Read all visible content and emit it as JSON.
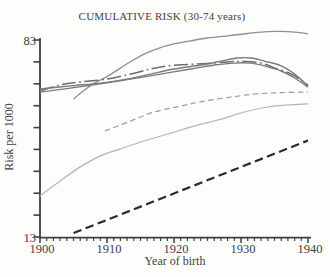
{
  "chart_data": {
    "type": "line",
    "title": "CUMULATIVE RISK (30-74 years)",
    "xlabel": "Year of birth",
    "ylabel": "Risk per 1000",
    "x_axis": {
      "min": 1900,
      "max": 1940,
      "major_ticks": [
        1900,
        1910,
        1920,
        1930,
        1940
      ],
      "tick_labels": [
        "1900",
        "1910",
        "1920",
        "1930",
        "1940"
      ],
      "minor_tick_interval": 1
    },
    "y_axis": {
      "min": 13,
      "max": 83,
      "tick_count": 10,
      "labeled_ticks": [
        {
          "label": "83",
          "value": 83
        },
        {
          "label": "13",
          "value": 13
        }
      ]
    },
    "grid": false,
    "legend": "none",
    "series": [
      {
        "name": "upper-solid-curve",
        "line_style": "solid",
        "color": "#8f8f8f",
        "width": 1.3,
        "points": [
          [
            1905,
            62.0
          ],
          [
            1906.5,
            65.0
          ],
          [
            1908,
            67.5
          ],
          [
            1910,
            70.0
          ],
          [
            1912,
            73.0
          ],
          [
            1914,
            76.0
          ],
          [
            1916,
            78.5
          ],
          [
            1918,
            80.3
          ],
          [
            1920,
            81.6
          ],
          [
            1922,
            82.5
          ],
          [
            1925,
            83.7
          ],
          [
            1928,
            84.5
          ],
          [
            1931,
            85.3
          ],
          [
            1934,
            86.0
          ],
          [
            1937,
            86.0
          ],
          [
            1940,
            85.2
          ]
        ]
      },
      {
        "name": "dash-dot-curve",
        "line_style": "dash-dot",
        "color": "#6d6d6d",
        "width": 1.5,
        "points": [
          [
            1900,
            64.9
          ],
          [
            1903,
            67.0
          ],
          [
            1906,
            68.1
          ],
          [
            1910,
            69.1
          ],
          [
            1913.5,
            70.9
          ],
          [
            1916.5,
            72.7
          ],
          [
            1919,
            73.8
          ],
          [
            1922,
            74.3
          ],
          [
            1925,
            74.7
          ],
          [
            1928,
            75.2
          ],
          [
            1930.5,
            75.4
          ],
          [
            1933,
            74.8
          ],
          [
            1935,
            73.1
          ],
          [
            1937.5,
            70.9
          ],
          [
            1940,
            67.0
          ]
        ]
      },
      {
        "name": "dark-solid-curve-a",
        "line_style": "solid",
        "color": "#7a7a7a",
        "width": 1.4,
        "points": [
          [
            1900,
            65.6
          ],
          [
            1904.5,
            66.7
          ],
          [
            1909,
            67.7
          ],
          [
            1913,
            69.1
          ],
          [
            1916.5,
            70.9
          ],
          [
            1920,
            72.7
          ],
          [
            1924,
            74.1
          ],
          [
            1927,
            75.5
          ],
          [
            1929.5,
            76.6
          ],
          [
            1931.5,
            76.6
          ],
          [
            1933.5,
            75.5
          ],
          [
            1936,
            73.8
          ],
          [
            1938,
            70.9
          ],
          [
            1940,
            66.7
          ]
        ]
      },
      {
        "name": "dark-solid-curve-b",
        "line_style": "solid",
        "color": "#7a7a7a",
        "width": 1.4,
        "points": [
          [
            1900,
            64.5
          ],
          [
            1904.5,
            65.9
          ],
          [
            1909,
            67.4
          ],
          [
            1913.5,
            69.1
          ],
          [
            1918,
            70.9
          ],
          [
            1922.5,
            72.7
          ],
          [
            1926,
            74.1
          ],
          [
            1929,
            74.8
          ],
          [
            1931.5,
            74.8
          ],
          [
            1933.5,
            73.8
          ],
          [
            1936,
            72.0
          ],
          [
            1938,
            69.5
          ],
          [
            1940,
            66.3
          ]
        ]
      },
      {
        "name": "medium-dashed-curve",
        "line_style": "dashed",
        "color": "#9b9b9b",
        "width": 1.2,
        "points": [
          [
            1909.7,
            50.7
          ],
          [
            1913.5,
            54.2
          ],
          [
            1917,
            57.4
          ],
          [
            1921,
            59.5
          ],
          [
            1924.5,
            61.3
          ],
          [
            1928.5,
            62.7
          ],
          [
            1932,
            63.8
          ],
          [
            1936,
            64.3
          ],
          [
            1940,
            64.5
          ]
        ]
      },
      {
        "name": "light-solid-curve",
        "line_style": "solid",
        "color": "#b5b5b5",
        "width": 1.25,
        "points": [
          [
            1900,
            27.6
          ],
          [
            1903,
            32.9
          ],
          [
            1906,
            37.9
          ],
          [
            1909,
            41.8
          ],
          [
            1912,
            44.3
          ],
          [
            1915.5,
            47.1
          ],
          [
            1919.5,
            49.9
          ],
          [
            1923,
            52.4
          ],
          [
            1927,
            54.9
          ],
          [
            1930.5,
            57.4
          ],
          [
            1934,
            59.2
          ],
          [
            1937,
            59.9
          ],
          [
            1940,
            60.3
          ]
        ]
      },
      {
        "name": "black-bold-dashed-line",
        "line_style": "bold-dashed",
        "color": "#2b2b2b",
        "width": 2.2,
        "points": [
          [
            1905,
            14.4
          ],
          [
            1940,
            47.3
          ]
        ]
      }
    ],
    "colors": {
      "axis": "#3f3f3f",
      "text": "#3e3e3e",
      "background": "#fdfdfc"
    }
  }
}
